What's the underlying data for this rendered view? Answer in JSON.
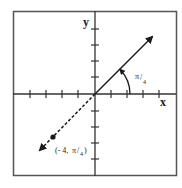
{
  "diagram": {
    "type": "polar-coordinate-plot",
    "axes": {
      "x_label": "x",
      "y_label": "y",
      "tick_count_each_side": 4
    },
    "angle_label_num": "π",
    "angle_label_den": "4",
    "angle_label": "π/4",
    "point_label_prefix": "(- 4, ",
    "point_label_num": "π",
    "point_label_den": "4",
    "point_label_suffix": ")",
    "point_label": "(- 4, π/4)",
    "point": {
      "r": -4,
      "theta": "π/4"
    },
    "colors": {
      "line": "#1a1a1a",
      "frame": "#444444",
      "background": "#ffffff"
    }
  }
}
